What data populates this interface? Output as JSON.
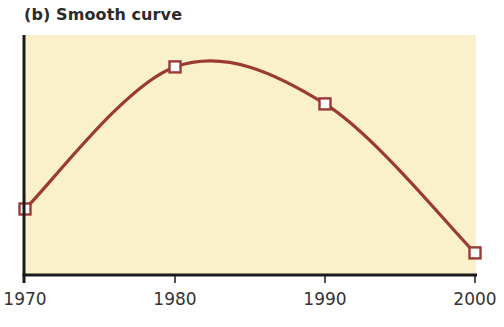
{
  "chart_data": {
    "type": "line",
    "title": "(b) Smooth curve",
    "xlabel": "",
    "ylabel": "",
    "x": [
      1970,
      1980,
      1990,
      2000
    ],
    "categories": [
      "1970",
      "1980",
      "1990",
      "2000"
    ],
    "series": [
      {
        "name": "Smooth curve",
        "values": [
          27.5,
          86.7,
          71.3,
          9.2
        ],
        "interpolation": "smooth",
        "marker": "hollow-square"
      }
    ],
    "y_units": "relative (no y tick labels shown; 0 = x-axis, 100 = top of plot area)",
    "xlim": [
      1970,
      2000
    ],
    "ylim": [
      0,
      100
    ],
    "x_ticks": [
      "1970",
      "1980",
      "1990",
      "2000"
    ],
    "y_ticks": [],
    "grid": false,
    "legend": "none"
  },
  "colors": {
    "plot_background": "#FAF0C9",
    "line": "#9B3A35",
    "marker_fill": "#FFFFFF",
    "axis": "#1A1A1A",
    "text": "#333333"
  },
  "layout": {
    "plot": {
      "left": 24,
      "top": 35,
      "right": 476,
      "bottom": 275
    }
  }
}
